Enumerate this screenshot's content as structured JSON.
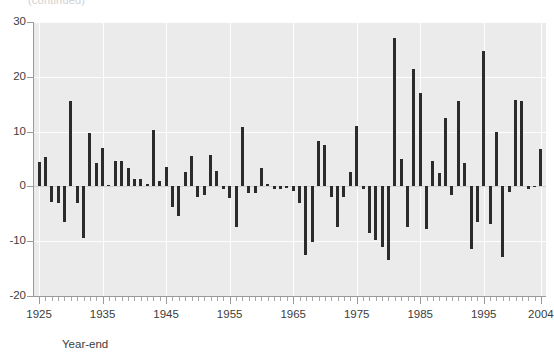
{
  "figure": {
    "clipped_title": "(continued)",
    "background_color": "#ffffff",
    "plot_background_color": "#ebebeb",
    "bar_color": "#2b2b2b",
    "gridline_color": "#fdfdfd"
  },
  "axes": {
    "x_title": "Year-end",
    "y_title": "",
    "y_ticks": [
      "30",
      "20",
      "10",
      "0",
      "-10",
      "-20"
    ],
    "x_ticks": [
      "1925",
      "1935",
      "1945",
      "1955",
      "1965",
      "1975",
      "1985",
      "1995",
      "2004"
    ]
  },
  "chart_data": {
    "type": "bar",
    "title": "",
    "xlabel": "Year-end",
    "ylabel": "",
    "xlim": [
      1924.2,
      2004.8
    ],
    "ylim": [
      -20,
      30
    ],
    "grid": true,
    "legend": "none",
    "y_tick_values": [
      30,
      20,
      10,
      0,
      -10,
      -20
    ],
    "x_tick_values": [
      1925,
      1935,
      1945,
      1955,
      1965,
      1975,
      1985,
      1995,
      2004
    ],
    "x_minor_tick_step": 1,
    "categories": [
      1925,
      1926,
      1927,
      1928,
      1929,
      1930,
      1931,
      1932,
      1933,
      1934,
      1935,
      1936,
      1937,
      1938,
      1939,
      1940,
      1941,
      1942,
      1943,
      1944,
      1945,
      1946,
      1947,
      1948,
      1949,
      1950,
      1951,
      1952,
      1953,
      1954,
      1955,
      1956,
      1957,
      1958,
      1959,
      1960,
      1961,
      1962,
      1963,
      1964,
      1965,
      1966,
      1967,
      1968,
      1969,
      1970,
      1971,
      1972,
      1973,
      1974,
      1975,
      1976,
      1977,
      1978,
      1979,
      1980,
      1981,
      1982,
      1983,
      1984,
      1985,
      1986,
      1987,
      1988,
      1989,
      1990,
      1991,
      1992,
      1993,
      1994,
      1995,
      1996,
      1997,
      1998,
      1999,
      2000,
      2001,
      2002,
      2003,
      2004
    ],
    "values": [
      4.4,
      5.3,
      -2.9,
      -3.0,
      -6.5,
      15.6,
      -3.1,
      -9.5,
      9.7,
      4.3,
      7.0,
      0.2,
      4.6,
      4.6,
      3.4,
      1.3,
      1.4,
      0.4,
      10.3,
      0.9,
      3.6,
      -3.8,
      -5.4,
      2.6,
      5.5,
      -2.0,
      -1.5,
      5.8,
      2.8,
      -0.5,
      -2.1,
      -7.5,
      10.8,
      -1.2,
      -1.2,
      3.4,
      0.4,
      -0.5,
      -0.4,
      -0.3,
      -0.8,
      -3.1,
      -12.5,
      -10.1,
      8.2,
      7.6,
      -1.9,
      -7.4,
      -2.0,
      2.6,
      11.0,
      -0.4,
      -8.5,
      -9.7,
      -11.0,
      -13.5,
      27.0,
      5.0,
      -7.5,
      21.5,
      17.0,
      -7.7,
      4.7,
      2.5,
      12.5,
      -1.5,
      15.6,
      4.2,
      -11.5,
      -6.5,
      24.7,
      -6.9,
      10.0,
      -12.8,
      -1.0,
      15.7,
      15.5,
      -0.5,
      0.0,
      6.8
    ]
  }
}
